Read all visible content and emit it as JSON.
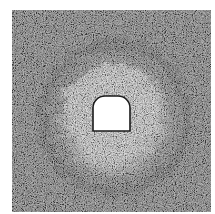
{
  "figure": {
    "type": "tunnel-damage-zone-simulation",
    "domain_box": {
      "x": 12,
      "y": 10,
      "width": 199,
      "height": 202
    },
    "colors": {
      "background": "#ffffff",
      "rock_dark": "#6e6e6e",
      "rock_light": "#a8a8a8",
      "damage_zone": "#d8d8d8",
      "ring_dark": "#4a4a4a",
      "tunnel_fill": "#ffffff",
      "tunnel_outline": "#1a1a1a"
    },
    "tunnel": {
      "shape": "horseshoe",
      "x": 93,
      "y": 96,
      "width": 37,
      "height": 35,
      "arch_radius": 12
    },
    "damage_zone": {
      "center_x": 112,
      "center_y": 115,
      "radius_x": 58,
      "radius_y": 60
    }
  }
}
